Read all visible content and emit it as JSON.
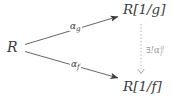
{
  "diagram": {
    "nodes": {
      "source": "R",
      "top_target": "R[1/g]",
      "bottom_target": "R[1/f]"
    },
    "arrows": {
      "top_label": {
        "base": "α",
        "sub": "g"
      },
      "bottom_label": {
        "base": "α",
        "sub": "f"
      },
      "dotted_label": {
        "base": "∃!α",
        "sup": "g",
        "sub": "f"
      }
    },
    "colors": {
      "ink": "#3d3d3d",
      "muted": "#9a9a9a",
      "background": "#ffffff"
    }
  }
}
